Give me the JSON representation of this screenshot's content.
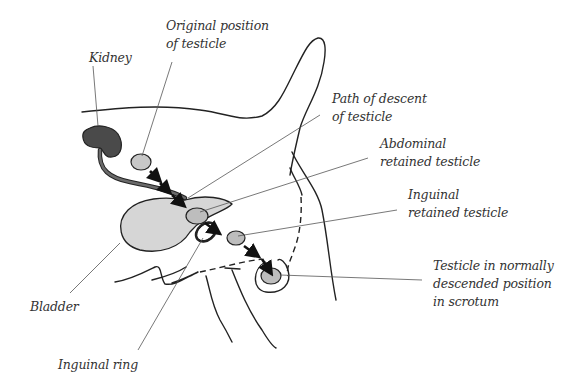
{
  "diagram": {
    "type": "anatomical illustration",
    "colors": {
      "kidney": "#4a4a4a",
      "testicle": "#bdbdbd",
      "bladder": "#d6d6d6",
      "outline": "#222222",
      "label_text": "#333333"
    },
    "labels": {
      "kidney": "Kidney",
      "original_position_line1": "Original position",
      "original_position_line2": "of testicle",
      "path_descent_line1": "Path of descent",
      "path_descent_line2": "of testicle",
      "abdominal_line1": "Abdominal",
      "abdominal_line2": "retained testicle",
      "inguinal_retained_line1": "Inguinal",
      "inguinal_retained_line2": "retained testicle",
      "scrotum_line1": "Testicle in normally",
      "scrotum_line2": "descended position",
      "scrotum_line3": "in scrotum",
      "bladder": "Bladder",
      "inguinal_ring": "Inguinal ring"
    }
  }
}
